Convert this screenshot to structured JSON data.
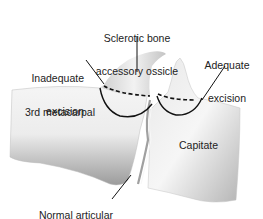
{
  "figure": {
    "type": "anatomical illustration",
    "labels": {
      "sclerotic": {
        "line1": "Sclerotic bone",
        "line2": "accessory ossicle"
      },
      "inadequate": {
        "line1": "Inadequate",
        "line2": "excision"
      },
      "adequate": {
        "line1": "Adequate",
        "line2": "excision"
      },
      "metacarpal": "3rd metacarpal",
      "capitate": "Capitate",
      "cartilage": {
        "line1": "Normal articular",
        "line2": "cartilage"
      }
    },
    "legend_lines": {
      "dashed": "excision boundary (dashed)",
      "solid": "excision boundary (solid)"
    },
    "colors": {
      "bone_light": "#f2f2f2",
      "bone_mid": "#d6d6d6",
      "bone_dark": "#a8a8a8",
      "line": "#111111",
      "text": "#222222"
    }
  }
}
